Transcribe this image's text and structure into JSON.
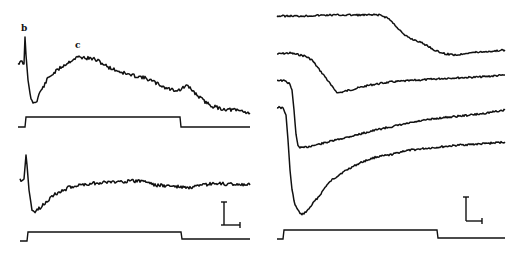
{
  "figure": {
    "background": "#ffffff",
    "ink": "#111111",
    "labels": {
      "b": "b",
      "c": "c"
    }
  },
  "chart_data": [
    {
      "type": "line",
      "title": "",
      "panel": "left-top",
      "xlabel": "",
      "ylabel": "",
      "annotations": [
        {
          "text": "b",
          "x_px": 23,
          "y_px": 31,
          "note": "initial transient spike"
        },
        {
          "text": "c",
          "x_px": 77,
          "y_px": 47,
          "note": "slow peak"
        }
      ],
      "series": [
        {
          "name": "response",
          "points_px": [
            [
              18,
              63
            ],
            [
              22,
              62
            ],
            [
              24,
              64
            ],
            [
              25,
              37
            ],
            [
              26,
              55
            ],
            [
              28,
              80
            ],
            [
              31,
              100
            ],
            [
              34,
              103
            ],
            [
              37,
              100
            ],
            [
              40,
              92
            ],
            [
              44,
              86
            ],
            [
              48,
              78
            ],
            [
              54,
              73
            ],
            [
              60,
              68
            ],
            [
              66,
              64
            ],
            [
              72,
              60
            ],
            [
              78,
              57
            ],
            [
              86,
              58
            ],
            [
              94,
              59
            ],
            [
              100,
              62
            ],
            [
              108,
              67
            ],
            [
              118,
              71
            ],
            [
              130,
              75
            ],
            [
              142,
              77
            ],
            [
              150,
              80
            ],
            [
              158,
              84
            ],
            [
              166,
              88
            ],
            [
              174,
              90
            ],
            [
              180,
              90
            ],
            [
              186,
              86
            ],
            [
              190,
              88
            ],
            [
              196,
              94
            ],
            [
              204,
              101
            ],
            [
              212,
              106
            ],
            [
              222,
              109
            ],
            [
              234,
              110
            ],
            [
              242,
              111
            ],
            [
              250,
              113
            ]
          ]
        },
        {
          "name": "stimulus",
          "points_px": [
            [
              18,
              127
            ],
            [
              25,
              127
            ],
            [
              26,
              117
            ],
            [
              180,
              117
            ],
            [
              181,
              127
            ],
            [
              250,
              127
            ]
          ]
        }
      ],
      "grid": false
    },
    {
      "type": "line",
      "title": "",
      "panel": "left-bottom",
      "xlabel": "",
      "ylabel": "",
      "series": [
        {
          "name": "response",
          "points_px": [
            [
              20,
              180
            ],
            [
              24,
              179
            ],
            [
              26,
              155
            ],
            [
              27,
              165
            ],
            [
              29,
              190
            ],
            [
              32,
              210
            ],
            [
              35,
              212
            ],
            [
              40,
              208
            ],
            [
              46,
              202
            ],
            [
              52,
              196
            ],
            [
              60,
              192
            ],
            [
              70,
              187
            ],
            [
              80,
              185
            ],
            [
              95,
              183
            ],
            [
              110,
              182
            ],
            [
              130,
              181
            ],
            [
              145,
              181
            ],
            [
              155,
              185
            ],
            [
              170,
              186
            ],
            [
              190,
              188
            ],
            [
              210,
              184
            ],
            [
              230,
              184
            ],
            [
              250,
              185
            ]
          ]
        },
        {
          "name": "stimulus",
          "points_px": [
            [
              20,
              241
            ],
            [
              27,
              241
            ],
            [
              28,
              232
            ],
            [
              181,
              232
            ],
            [
              182,
              239
            ],
            [
              250,
              239
            ]
          ]
        }
      ],
      "scale_bar": {
        "vertical_px": [
          [
            224,
            202
          ],
          [
            224,
            225
          ]
        ],
        "horizontal_px": [
          [
            221,
            225
          ],
          [
            240,
            225
          ]
        ]
      },
      "grid": false
    },
    {
      "type": "line",
      "title": "",
      "panel": "right",
      "xlabel": "",
      "ylabel": "",
      "series": [
        {
          "name": "trace-1",
          "points_px": [
            [
              277,
              16
            ],
            [
              300,
              16
            ],
            [
              330,
              15
            ],
            [
              380,
              15
            ],
            [
              388,
              18
            ],
            [
              396,
              26
            ],
            [
              404,
              35
            ],
            [
              412,
              39
            ],
            [
              420,
              42
            ],
            [
              428,
              46
            ],
            [
              436,
              51
            ],
            [
              446,
              54
            ],
            [
              458,
              55
            ],
            [
              466,
              53
            ],
            [
              480,
              52
            ],
            [
              495,
              51
            ],
            [
              505,
              50
            ]
          ]
        },
        {
          "name": "trace-2",
          "points_px": [
            [
              277,
              54
            ],
            [
              290,
              53
            ],
            [
              305,
              56
            ],
            [
              312,
              60
            ],
            [
              318,
              68
            ],
            [
              326,
              78
            ],
            [
              333,
              88
            ],
            [
              338,
              93
            ],
            [
              350,
              90
            ],
            [
              370,
              85
            ],
            [
              390,
              82
            ],
            [
              420,
              80
            ],
            [
              450,
              78
            ],
            [
              480,
              77
            ],
            [
              505,
              75
            ]
          ]
        },
        {
          "name": "trace-3",
          "points_px": [
            [
              277,
              80
            ],
            [
              285,
              81
            ],
            [
              290,
              84
            ],
            [
              292,
              90
            ],
            [
              294,
              110
            ],
            [
              296,
              135
            ],
            [
              298,
              146
            ],
            [
              302,
              148
            ],
            [
              320,
              144
            ],
            [
              340,
              139
            ],
            [
              360,
              134
            ],
            [
              380,
              129
            ],
            [
              400,
              125
            ],
            [
              420,
              121
            ],
            [
              440,
              118
            ],
            [
              460,
              116
            ],
            [
              480,
              114
            ],
            [
              505,
              110
            ]
          ]
        },
        {
          "name": "trace-4",
          "points_px": [
            [
              277,
              107
            ],
            [
              283,
              108
            ],
            [
              286,
              115
            ],
            [
              288,
              140
            ],
            [
              290,
              170
            ],
            [
              292,
              190
            ],
            [
              295,
              205
            ],
            [
              299,
              212
            ],
            [
              302,
              215
            ],
            [
              308,
              210
            ],
            [
              314,
              202
            ],
            [
              320,
              195
            ],
            [
              326,
              186
            ],
            [
              332,
              180
            ],
            [
              340,
              174
            ],
            [
              350,
              168
            ],
            [
              362,
              162
            ],
            [
              376,
              157
            ],
            [
              390,
              155
            ],
            [
              404,
              151
            ],
            [
              420,
              149
            ],
            [
              440,
              147
            ],
            [
              460,
              145
            ],
            [
              480,
              144
            ],
            [
              505,
              142
            ]
          ]
        },
        {
          "name": "stimulus",
          "points_px": [
            [
              277,
              239
            ],
            [
              283,
              239
            ],
            [
              284,
              230
            ],
            [
              437,
              230
            ],
            [
              438,
              238
            ],
            [
              505,
              238
            ]
          ]
        }
      ],
      "scale_bar": {
        "vertical_px": [
          [
            466,
            197
          ],
          [
            466,
            221
          ]
        ],
        "horizontal_px": [
          [
            466,
            221
          ],
          [
            482,
            221
          ]
        ]
      },
      "grid": false
    }
  ]
}
